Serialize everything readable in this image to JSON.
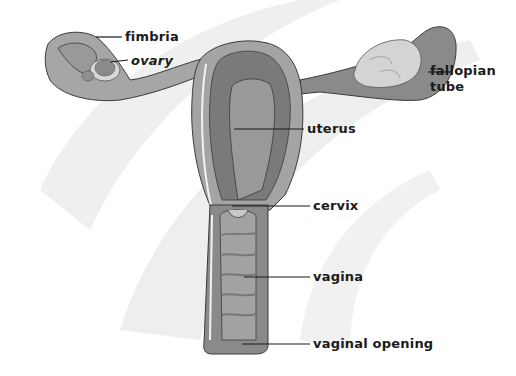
{
  "diagram": {
    "colors": {
      "background": "#ffffff",
      "swoosh": "#ececec",
      "tissue_outer": "#a8a8a8",
      "tissue_mid": "#8c8c8c",
      "tissue_dark": "#6e6e6e",
      "ovary_light": "#d6d6d6",
      "outline": "#3a3a3a",
      "leader_line": "#1a1a1a",
      "label_text": "#1a1a1a"
    },
    "labels": [
      {
        "id": "fimbria",
        "text": "fimbria"
      },
      {
        "id": "ovary",
        "text": "ovary"
      },
      {
        "id": "fallopian-tube-1",
        "text": "fallopian"
      },
      {
        "id": "fallopian-tube-2",
        "text": "tube"
      },
      {
        "id": "uterus",
        "text": "uterus"
      },
      {
        "id": "cervix",
        "text": "cervix"
      },
      {
        "id": "vagina",
        "text": "vagina"
      },
      {
        "id": "vaginal-opening",
        "text": "vaginal opening"
      }
    ]
  }
}
